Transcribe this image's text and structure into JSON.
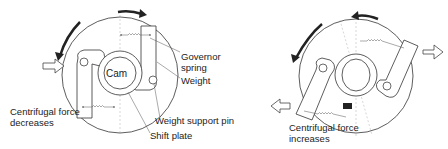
{
  "left_diagram": {
    "state": "Centrifugal force decreases",
    "labels": {
      "cam": "Cam",
      "governor_spring_1": "Governor",
      "governor_spring_2": "spring",
      "weight": "Weight",
      "weight_support_pin": "Weight support pin",
      "shift_plate": "Shift plate",
      "force_1": "Centrifugal force",
      "force_2": "decreases"
    },
    "rotation": "counter-clockwise and clockwise arrows",
    "force_arrow_direction": "inward"
  },
  "right_diagram": {
    "state": "Centrifugal force increases",
    "labels": {
      "force_1": "Centrifugal force",
      "force_2": "increases"
    },
    "force_arrow_direction": "outward"
  },
  "colors": {
    "line": "#333333",
    "background": "#ffffff",
    "arrow": "#222222"
  }
}
